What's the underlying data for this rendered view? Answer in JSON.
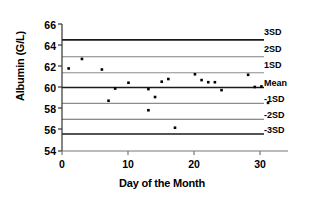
{
  "chart_data": {
    "type": "scatter",
    "title": "",
    "xlabel": "Day of the Month",
    "ylabel": "Albumin (G/L)",
    "xlim": [
      0,
      34
    ],
    "ylim": [
      54,
      66
    ],
    "xticks": [
      0,
      10,
      20,
      30
    ],
    "yticks": [
      54,
      56,
      58,
      60,
      62,
      64,
      66
    ],
    "xtick_labels": [
      "0",
      "10",
      "20",
      "30"
    ],
    "ytick_labels": [
      "54",
      "56",
      "58",
      "60",
      "62",
      "64",
      "66"
    ],
    "grid": false,
    "legend": "none",
    "marker": "square",
    "marker_color": "#000000",
    "x": [
      1,
      3,
      6,
      7,
      8,
      10,
      13,
      13,
      14,
      15,
      16,
      17,
      20,
      21,
      22,
      23,
      24,
      28,
      29,
      30,
      31
    ],
    "y": [
      61.8,
      62.7,
      61.7,
      58.75,
      59.9,
      60.45,
      59.85,
      57.85,
      59.1,
      60.55,
      60.8,
      56.2,
      61.25,
      60.7,
      60.5,
      60.5,
      59.75,
      61.2,
      60.05,
      60.1,
      58.55
    ],
    "points": [
      {
        "day": 1,
        "value": 61.8
      },
      {
        "day": 3,
        "value": 62.7
      },
      {
        "day": 6,
        "value": 61.7
      },
      {
        "day": 7,
        "value": 58.75
      },
      {
        "day": 8,
        "value": 59.9
      },
      {
        "day": 10,
        "value": 60.45
      },
      {
        "day": 13,
        "value": 59.85
      },
      {
        "day": 13,
        "value": 57.85
      },
      {
        "day": 14,
        "value": 59.1
      },
      {
        "day": 15,
        "value": 60.55
      },
      {
        "day": 16,
        "value": 60.8
      },
      {
        "day": 17,
        "value": 56.2
      },
      {
        "day": 20,
        "value": 61.25
      },
      {
        "day": 21,
        "value": 60.7
      },
      {
        "day": 22,
        "value": 60.5
      },
      {
        "day": 23,
        "value": 60.5
      },
      {
        "day": 24,
        "value": 59.75
      },
      {
        "day": 28,
        "value": 61.2
      },
      {
        "day": 29,
        "value": 60.05
      },
      {
        "day": 30,
        "value": 60.1
      },
      {
        "day": 31,
        "value": 58.55
      }
    ],
    "control_lines": [
      {
        "label": "3SD",
        "value": 64.5,
        "color": "#1a1a1a",
        "width": 1.6
      },
      {
        "label": "2SD",
        "value": 62.9,
        "color": "#808080",
        "width": 1.1
      },
      {
        "label": "1SD",
        "value": 61.4,
        "color": "#8c8c8c",
        "width": 1.1
      },
      {
        "label": "Mean",
        "value": 60.0,
        "color": "#1a1a1a",
        "width": 1.6
      },
      {
        "label": "-1SD",
        "value": 58.5,
        "color": "#8c8c8c",
        "width": 1.1
      },
      {
        "label": "-2SD",
        "value": 57.0,
        "color": "#666666",
        "width": 1.1
      },
      {
        "label": "-3SD",
        "value": 55.6,
        "color": "#1a1a1a",
        "width": 1.6
      }
    ]
  },
  "axes": {
    "y_title": "Albumin (G/L)",
    "x_title": "Day of the Month",
    "y_labels": [
      "66",
      "64",
      "62",
      "60",
      "58",
      "56",
      "54"
    ],
    "x_labels": [
      "0",
      "10",
      "20",
      "30"
    ]
  },
  "sd_labels": [
    "3SD",
    "2SD",
    "1SD",
    "Mean",
    "-1SD",
    "-2SD",
    "-3SD"
  ],
  "colors": {
    "background": "#ffffff",
    "axis": "#333333",
    "marker": "#000000",
    "mean_line": "#1a1a1a",
    "sd_line": "#8c8c8c"
  }
}
